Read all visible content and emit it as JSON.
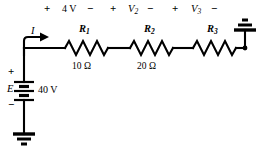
{
  "figure": {
    "name": "series-resistive-circuit",
    "type": "schematic",
    "background_color": "#ffffff",
    "line_color": "#000000"
  },
  "source": {
    "symbol": "battery-multicell",
    "designator": "E",
    "value": "40 V",
    "plus_sign": "+",
    "minus_sign": "−",
    "ground": "earth-ground"
  },
  "current": {
    "label": "I",
    "arrow": "arrow-right"
  },
  "drops": [
    {
      "plus": "+",
      "value": "4 V",
      "minus": "−"
    },
    {
      "plus": "+",
      "value_base": "V",
      "value_sub": "2",
      "minus": "−"
    },
    {
      "plus": "+",
      "value_base": "V",
      "value_sub": "3",
      "minus": "−"
    }
  ],
  "resistors": [
    {
      "name_base": "R",
      "name_sub": "1",
      "value": "10 Ω"
    },
    {
      "name_base": "R",
      "name_sub": "2",
      "value": "20 Ω"
    },
    {
      "name_base": "R",
      "name_sub": "3",
      "value": ""
    }
  ],
  "right_terminal": {
    "symbol": "earth-ground"
  }
}
